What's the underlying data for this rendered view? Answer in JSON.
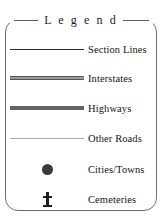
{
  "panel": {
    "name": "map-legend",
    "title": "L e g e n d",
    "title_plain": "Legend"
  },
  "entries": [
    {
      "label": "Section Lines",
      "symbol": "thin-line",
      "symbol_name": "section-line-swatch",
      "color": "#2d2d2d"
    },
    {
      "label": "Interstates",
      "symbol": "cased-thick-line",
      "symbol_name": "interstate-line-swatch",
      "color": "#8c8c8c"
    },
    {
      "label": "Highways",
      "symbol": "thick-line",
      "symbol_name": "highway-line-swatch",
      "color": "#636363"
    },
    {
      "label": "Other Roads",
      "symbol": "hairline",
      "symbol_name": "other-road-line-swatch",
      "color": "#a8a8a8"
    },
    {
      "label": "Cities/Towns",
      "symbol": "filled-circle",
      "symbol_name": "city-dot-symbol",
      "color": "#3a3a3a"
    },
    {
      "label": "Cemeteries",
      "symbol": "cross",
      "symbol_name": "cemetery-cross-symbol",
      "color": "#1e1e1e"
    }
  ],
  "style": {
    "border_color": "#6e6e6e",
    "text_color": "#141414",
    "background": "#ffffff"
  }
}
